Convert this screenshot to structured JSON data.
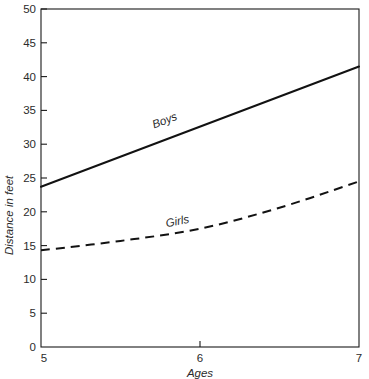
{
  "chart_data": {
    "type": "line",
    "title": "",
    "xlabel": "Ages",
    "ylabel": "Distance in feet",
    "xlim": [
      5,
      7
    ],
    "ylim": [
      0,
      50
    ],
    "grid": false,
    "legend_position": "inline-on-curve",
    "x_ticks": [
      "5",
      "6",
      "7"
    ],
    "x_tick_values": [
      5,
      6,
      7
    ],
    "y_ticks": [
      "0",
      "5",
      "10",
      "15",
      "20",
      "25",
      "30",
      "35",
      "40",
      "45",
      "50"
    ],
    "y_tick_values": [
      0,
      5,
      10,
      15,
      20,
      25,
      30,
      35,
      40,
      45,
      50
    ],
    "origin_label": "0",
    "x": [
      5,
      5.5,
      6,
      6.5,
      7
    ],
    "series": [
      {
        "name": "Boys",
        "style": "solid",
        "values": [
          23.7,
          28.1,
          32.5,
          37.0,
          41.5
        ],
        "label": "Boys"
      },
      {
        "name": "Girls",
        "style": "dashed",
        "values": [
          14.3,
          15.7,
          17.5,
          20.6,
          24.5
        ],
        "label": "Girls"
      }
    ]
  },
  "axes": {
    "y_axis_title": "Distance in feet",
    "x_axis_title": "Ages",
    "origin_zero": "0"
  },
  "labels": {
    "boys": "Boys",
    "girls": "Girls"
  },
  "y_tick_text": {
    "t50": "50",
    "t45": "45",
    "t40": "40",
    "t35": "35",
    "t30": "30",
    "t25": "25",
    "t20": "20",
    "t15": "15",
    "t10": "10",
    "t5": "5",
    "t0": "0"
  },
  "x_tick_text": {
    "t5": "5",
    "t6": "6",
    "t7": "7"
  },
  "colors": {
    "line": "#121212",
    "frame": "#1a1a1a",
    "text": "#2b2b2b",
    "background": "#ffffff"
  }
}
